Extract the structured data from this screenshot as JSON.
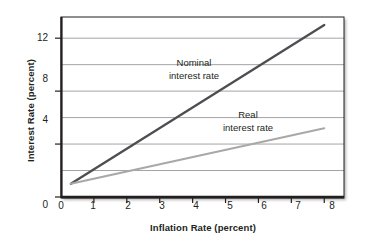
{
  "chart_data": {
    "type": "line",
    "title": "",
    "xlabel": "Inflation Rate (percent)",
    "ylabel": "Interest Rate (percent)",
    "xlim": [
      0,
      8.6
    ],
    "ylim": [
      0,
      13.6
    ],
    "xticks": [
      "0",
      "1",
      "2",
      "3",
      "4",
      "5",
      "6",
      "7",
      "8"
    ],
    "xtick_values": [
      0,
      1,
      2,
      3,
      4,
      5,
      6,
      7,
      8
    ],
    "yticks": [
      "0",
      "4",
      "8",
      "12"
    ],
    "ytick_values": [
      0,
      4,
      8,
      12
    ],
    "gridlines_y": [
      2,
      4,
      6,
      8,
      10,
      12
    ],
    "grid": "horizontal",
    "legend": "none",
    "series": [
      {
        "name": "Nominal interest rate",
        "color": "#4d4d52",
        "x": [
          0.3,
          8.0
        ],
        "values": [
          1.0,
          13.0
        ],
        "slope": 1.56,
        "intercept": 0.53
      },
      {
        "name": "Real interest rate",
        "color": "#a8a8a8",
        "x": [
          0.3,
          8.0
        ],
        "values": [
          1.0,
          5.2
        ],
        "slope": 0.55,
        "intercept": 0.84
      }
    ],
    "annotations": [
      {
        "name": "nominal-label",
        "line1": "Nominal",
        "line2": "interest rate",
        "x": 3.1,
        "y": 9.6
      },
      {
        "name": "real-label",
        "line1": "Real",
        "line2": "interest rate",
        "x": 5.3,
        "y": 6.2
      }
    ]
  },
  "axes": {
    "y_title": "Interest Rate (percent)",
    "x_title": "Inflation Rate (percent)"
  },
  "colors": {
    "nominal_line": "#4d4d52",
    "real_line": "#a8a8a8",
    "gridline": "#9a9a9a",
    "axis": "#231f20",
    "text": "#231f20",
    "background": "#ffffff"
  }
}
